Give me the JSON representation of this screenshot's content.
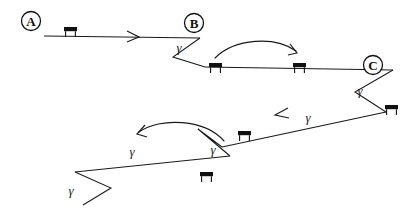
{
  "figure": {
    "type": "diagram",
    "canvas": {
      "width": 417,
      "height": 214,
      "background": "#ffffff"
    },
    "stroke_color": "#1a1a1a",
    "label_color": "#111111"
  },
  "waypoints": [
    {
      "id": "A",
      "label": "A",
      "cx": 31,
      "cy": 21,
      "r": 9.5
    },
    {
      "id": "B",
      "label": "B",
      "cx": 194,
      "cy": 23,
      "r": 9.5
    },
    {
      "id": "C",
      "label": "C",
      "cx": 373,
      "cy": 65,
      "r": 9.5
    }
  ],
  "angle_labels": [
    {
      "id": "gamma-b",
      "text": "γ",
      "x": 179,
      "y": 47
    },
    {
      "id": "gamma-c",
      "text": "γ",
      "x": 360,
      "y": 90
    },
    {
      "id": "gamma-m1",
      "text": "γ",
      "x": 308,
      "y": 117
    },
    {
      "id": "gamma-m2",
      "text": "γ",
      "x": 213,
      "y": 149
    },
    {
      "id": "gamma-m3",
      "text": "γ",
      "x": 132,
      "y": 151
    },
    {
      "id": "gamma-d",
      "text": "γ",
      "x": 71,
      "y": 190
    }
  ],
  "benches": [
    {
      "id": "bench-lane-1",
      "x": 64,
      "y": 27
    },
    {
      "id": "bench-lane-2a",
      "x": 209,
      "y": 63
    },
    {
      "id": "bench-lane-2b",
      "x": 293,
      "y": 63
    },
    {
      "id": "bench-lane-3",
      "x": 385,
      "y": 105
    },
    {
      "id": "bench-lane-4",
      "x": 238,
      "y": 131
    },
    {
      "id": "bench-lane-5",
      "x": 200,
      "y": 172
    }
  ],
  "lanes": [
    {
      "id": "lane-1",
      "description": "Top lane travelling left to right from A toward B",
      "points": "44,36 200,38",
      "direction": "right"
    },
    {
      "id": "lane-2",
      "description": "Second lane travelling right to left direction reversed, from B turn to C",
      "points": "205,67 393,70",
      "direction": "right"
    },
    {
      "id": "lane-3",
      "description": "Third lane travelling right to left from C turn toward middle",
      "points": "386,112 222,147",
      "direction": "left"
    },
    {
      "id": "lane-4",
      "description": "Fourth lane travelling left to right toward lower left turn",
      "points": "230,156 75,172",
      "direction": "left"
    }
  ],
  "turns": [
    {
      "id": "turn-b",
      "description": "V shaped hairpin turn at waypoint B",
      "points": "200,38 173,57 205,67"
    },
    {
      "id": "turn-c",
      "description": "V shaped hairpin turn at waypoint C",
      "points": "393,70 355,92 386,112"
    },
    {
      "id": "turn-middle",
      "description": "V shaped hairpin turn at middle of path",
      "points": "222,147 198,129 230,156"
    },
    {
      "id": "turn-lower-left",
      "description": "V shaped hairpin turn at lower left end of path",
      "points": "75,172 111,188 83,205"
    }
  ],
  "transition_arrows": [
    {
      "id": "transition-upper",
      "description": "Curved transition arrow over lane two pointing right",
      "path": "M 215,58 C 235,38 275,36 296,51",
      "head": "M 290,44 L 297,53 L 288,55",
      "direction": "right"
    },
    {
      "id": "transition-lower",
      "description": "Curved transition arrow over lane four pointing left",
      "path": "M 224,141 C 205,119 160,117 139,132",
      "head": "M 145,125 L 137,134 L 147,137",
      "direction": "left"
    }
  ],
  "lane_arrow_heads": [
    {
      "id": "arrowhead-lane-1",
      "path": "M 127,31 L 139,37 L 127,42",
      "direction": "right"
    },
    {
      "id": "arrowhead-lane-3",
      "path": "M 288,108 L 275,115 L 289,118",
      "direction": "left"
    }
  ]
}
